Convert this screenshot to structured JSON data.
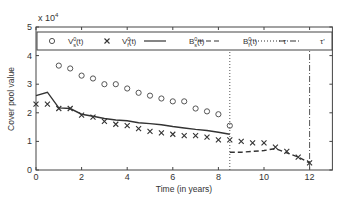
{
  "chart_data": {
    "type": "line",
    "title": "",
    "xlabel": "Time (in years)",
    "ylabel": "Cover pool value",
    "y_multiplier": "x 10",
    "y_multiplier_exp": "4",
    "xlim": [
      0,
      13
    ],
    "ylim": [
      0,
      5
    ],
    "xticks": [
      0,
      2,
      4,
      6,
      8,
      10,
      12
    ],
    "yticks": [
      0,
      1,
      2,
      3,
      4,
      5
    ],
    "grid": false,
    "legend_position": "top (inside, horizontal)",
    "series": [
      {
        "name": "V_s^0(t)",
        "label_main": "V",
        "label_sup": "0",
        "label_sub": "s",
        "label_arg": "(t)",
        "style": "circle markers",
        "x": [
          1,
          1.5,
          2,
          2.5,
          3,
          3.5,
          4,
          4.5,
          5,
          5.5,
          6,
          6.5,
          7,
          7.5,
          8,
          8.5
        ],
        "values": [
          3.65,
          3.55,
          3.3,
          3.2,
          3.0,
          3.0,
          2.85,
          2.7,
          2.6,
          2.5,
          2.4,
          2.4,
          2.15,
          2.05,
          1.95,
          1.55
        ]
      },
      {
        "name": "V_f^0(t)",
        "label_main": "V",
        "label_sup": "0",
        "label_sub": "f",
        "label_arg": "(t)",
        "style": "x markers",
        "x": [
          0,
          0.5,
          1,
          1.5,
          2,
          2.5,
          3,
          3.5,
          4,
          4.5,
          5,
          5.5,
          6,
          6.5,
          7,
          7.5,
          8,
          8.5,
          9,
          9.5,
          10,
          10.5,
          11,
          11.5,
          12
        ],
        "values": [
          2.3,
          2.3,
          2.15,
          2.15,
          1.92,
          1.85,
          1.7,
          1.6,
          1.55,
          1.45,
          1.35,
          1.3,
          1.25,
          1.2,
          1.2,
          1.15,
          1.05,
          1.05,
          1.0,
          0.95,
          0.95,
          0.8,
          0.65,
          0.45,
          0.25
        ]
      },
      {
        "name": "B_s^0(t)",
        "label_main": "B",
        "label_sup": "0",
        "label_sub": "s",
        "label_arg": "(t)",
        "style": "solid line",
        "x": [
          0,
          0.5,
          1,
          1.5,
          2,
          2.5,
          3,
          3.5,
          4,
          4.5,
          5,
          5.5,
          6,
          6.5,
          7,
          7.5,
          8,
          8.5
        ],
        "values": [
          2.6,
          2.72,
          2.17,
          2.15,
          1.95,
          1.88,
          1.8,
          1.75,
          1.72,
          1.65,
          1.62,
          1.58,
          1.52,
          1.47,
          1.42,
          1.38,
          1.32,
          1.25
        ]
      },
      {
        "name": "B_f^0(t)",
        "label_main": "B",
        "label_sup": "0",
        "label_sub": "f",
        "label_arg": "(t)",
        "style": "dashed line",
        "x": [
          8.5,
          9,
          9.5,
          10,
          10.5,
          11,
          11.5,
          12
        ],
        "values": [
          0.62,
          0.62,
          0.65,
          0.68,
          0.75,
          0.6,
          0.45,
          0.25
        ]
      },
      {
        "name": "tau",
        "label_main": "τ",
        "style": "dotted vertical line",
        "x": [
          8.5,
          8.5
        ],
        "values": [
          0,
          5
        ]
      },
      {
        "name": "tau'",
        "label_main": "τ'",
        "style": "dash-dot vertical line",
        "x": [
          12,
          12
        ],
        "values": [
          0,
          5
        ]
      }
    ]
  }
}
